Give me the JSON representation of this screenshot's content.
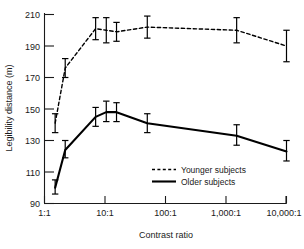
{
  "chart_data": {
    "type": "line",
    "title": "",
    "xlabel": "Contrast ratio",
    "ylabel": "Legibility distance (m)",
    "xscale": "log",
    "xlim": [
      1,
      10000
    ],
    "ylim": [
      85,
      212
    ],
    "yticks": [
      90,
      110,
      130,
      150,
      170,
      190,
      210
    ],
    "ytick_labels": [
      "90",
      "110",
      "130",
      "150",
      "170",
      "190",
      "210"
    ],
    "xticks": [
      1,
      10,
      100,
      1000,
      10000
    ],
    "xtick_labels": [
      "1:1",
      "10:1",
      "100:1",
      "1,000:1",
      "10,000:1"
    ],
    "grid": false,
    "legend_position": "center-right-inside",
    "series": [
      {
        "name": "Younger subjects",
        "style": "dashed",
        "color": "#000000",
        "x": [
          1.5,
          2.2,
          7.0,
          10.5,
          15.5,
          50,
          1500,
          10000
        ],
        "values": [
          141,
          176,
          201,
          200,
          199,
          202,
          200,
          190
        ],
        "error_low": [
          135,
          170,
          194,
          192,
          193,
          195,
          192,
          180
        ],
        "error_high": [
          147,
          182,
          208,
          208,
          205,
          209,
          208,
          200
        ]
      },
      {
        "name": "Older subjects",
        "style": "solid",
        "color": "#000000",
        "x": [
          1.5,
          2.2,
          7.0,
          10.5,
          15.5,
          50,
          1500,
          10000
        ],
        "values": [
          100,
          124,
          145,
          148,
          148,
          141,
          133,
          123
        ],
        "error_low": [
          96,
          119,
          139,
          142,
          142,
          135,
          127,
          117
        ],
        "error_high": [
          105,
          130,
          151,
          155,
          154,
          147,
          140,
          130
        ]
      }
    ]
  },
  "legend": {
    "entries": [
      {
        "label": "Younger subjects",
        "style": "dashed"
      },
      {
        "label": "Older subjects",
        "style": "solid"
      }
    ]
  }
}
